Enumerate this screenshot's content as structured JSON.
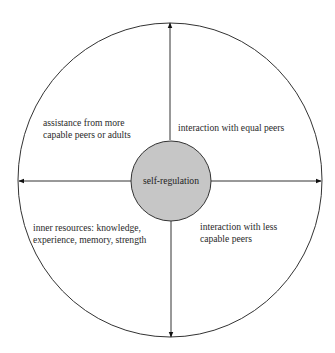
{
  "diagram": {
    "type": "concentric-quadrant-diagram",
    "center": {
      "label": "self-regulation",
      "fill": "#c6c6c6"
    },
    "outer_circle": {
      "stroke": "#333333"
    },
    "axes": [
      "up",
      "right",
      "down",
      "left"
    ],
    "quadrants": {
      "top_left": {
        "lines": [
          "assistance from more",
          "capable peers or adults"
        ]
      },
      "top_right": {
        "lines": [
          "interaction with equal peers"
        ]
      },
      "bottom_left": {
        "lines": [
          "inner resources: knowledge,",
          "experience, memory, strength"
        ]
      },
      "bottom_right": {
        "lines": [
          "interaction with less",
          "capable peers"
        ]
      }
    }
  }
}
